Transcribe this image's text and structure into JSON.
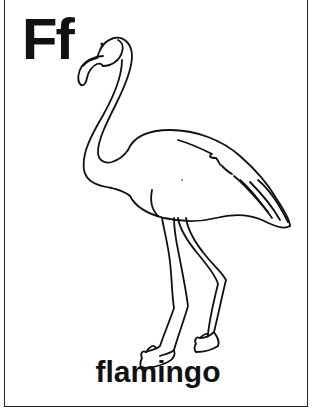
{
  "card": {
    "letters": "Ff",
    "word": "flamingo",
    "illustration": "flamingo-outline",
    "border_color": "#222222",
    "ink_color": "#111111",
    "background": "#ffffff"
  }
}
